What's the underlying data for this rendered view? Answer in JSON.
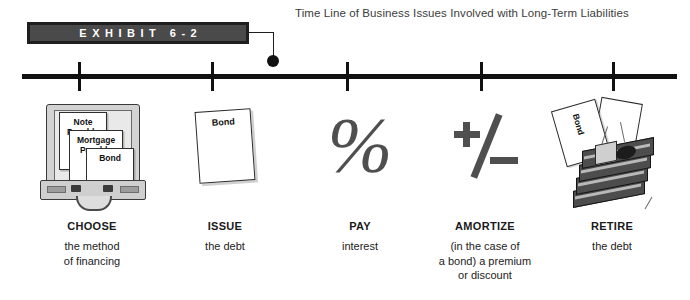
{
  "exhibit": {
    "banner_label": "EXHIBIT 6-2",
    "banner_bg": "#4a4a4a",
    "banner_border": "#1f1f1f",
    "banner_text_color": "#ffffff"
  },
  "title": "Time Line of Business Issues Involved with Long-Term Liabilities",
  "timeline": {
    "tick_positions": [
      79,
      212,
      347,
      481,
      613
    ],
    "axis_color": "#111111"
  },
  "stages": [
    {
      "title": "CHOOSE",
      "subtitle": "the method\nof financing",
      "subtitle_lines": [
        "the method",
        "of financing"
      ],
      "art": "briefcase-with-documents",
      "documents": [
        "Note Payable",
        "Mortgage Payable",
        "Bond"
      ],
      "doc_note_line1": "Note",
      "doc_note_line2": "Payable",
      "doc_mortgage_line1": "Mortgage",
      "doc_mortgage_line2": "Payable",
      "doc_bond": "Bond"
    },
    {
      "title": "ISSUE",
      "subtitle_lines": [
        "the debt"
      ],
      "art": "bond-certificate",
      "certificate_label": "Bond"
    },
    {
      "title": "PAY",
      "subtitle_lines": [
        "interest"
      ],
      "art": "percent-symbol",
      "glyph": "%"
    },
    {
      "title": "AMORTIZE",
      "subtitle_lines": [
        "(in the case of",
        "a bond) a premium",
        "or discount"
      ],
      "art": "plus-minus-symbol",
      "glyph": "+/−"
    },
    {
      "title": "RETIRE",
      "subtitle_lines": [
        "the debt"
      ],
      "art": "torn-bond-with-cash",
      "certificate_label": "Bond"
    }
  ]
}
